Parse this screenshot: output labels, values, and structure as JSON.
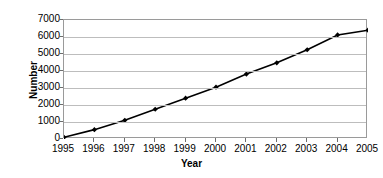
{
  "chart_data": {
    "type": "line",
    "title": "",
    "xlabel": "Year",
    "ylabel": "Number",
    "categories": [
      "1995",
      "1996",
      "1997",
      "1998",
      "1999",
      "2000",
      "2001",
      "2002",
      "2003",
      "2004",
      "2005"
    ],
    "values": [
      100,
      550,
      1100,
      1750,
      2400,
      3050,
      3820,
      4480,
      5250,
      6120,
      6400
    ],
    "series": [
      {
        "name": "Number",
        "values": [
          100,
          550,
          1100,
          1750,
          2400,
          3050,
          3820,
          4480,
          5250,
          6120,
          6400
        ]
      }
    ],
    "ylim": [
      0,
      7000
    ],
    "yticks": [
      0,
      1000,
      2000,
      3000,
      4000,
      5000,
      6000,
      7000
    ],
    "ytick_labels": [
      "0",
      "1000",
      "2000",
      "3000",
      "4000",
      "5000",
      "6000",
      "7000"
    ],
    "xtick_labels": [
      "1995",
      "1996",
      "1997",
      "1998",
      "1999",
      "2000",
      "2001",
      "2002",
      "2003",
      "2004",
      "2005"
    ],
    "grid": true,
    "legend": false,
    "legend_position": "none",
    "marker": "diamond",
    "line_color": "#000000",
    "marker_color": "#000000",
    "grid_color": "#bdbdbd",
    "axis_color": "#9a9a9a",
    "background_color": "#ffffff"
  }
}
